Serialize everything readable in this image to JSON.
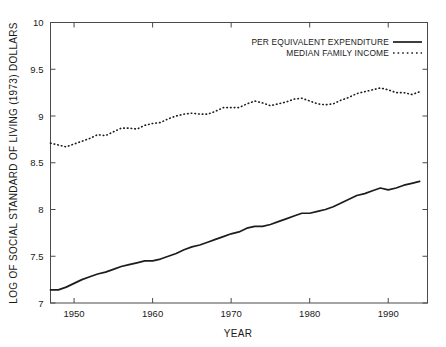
{
  "chart_data": {
    "type": "line",
    "title": "",
    "xlabel": "YEAR",
    "ylabel": "LOG OF SOCIAL STANDARD OF LIVING (1973) DOLLARS",
    "xlim": [
      1947,
      1995
    ],
    "ylim": [
      7,
      10
    ],
    "xticks": [
      1950,
      1960,
      1970,
      1980,
      1990
    ],
    "xticklabels": [
      "1950",
      "1960",
      "1970",
      "1980",
      "1990"
    ],
    "yticks": [
      7,
      7.5,
      8,
      8.5,
      9,
      9.5,
      10
    ],
    "yticklabels": [
      "7",
      "7.5",
      "8",
      "8.5",
      "9",
      "9.5",
      "10"
    ],
    "grid": false,
    "legend_position": "top-right",
    "x": [
      1947,
      1948,
      1949,
      1950,
      1951,
      1952,
      1953,
      1954,
      1955,
      1956,
      1957,
      1958,
      1959,
      1960,
      1961,
      1962,
      1963,
      1964,
      1965,
      1966,
      1967,
      1968,
      1969,
      1970,
      1971,
      1972,
      1973,
      1974,
      1975,
      1976,
      1977,
      1978,
      1979,
      1980,
      1981,
      1982,
      1983,
      1984,
      1985,
      1986,
      1987,
      1988,
      1989,
      1990,
      1991,
      1992,
      1993,
      1994
    ],
    "series": [
      {
        "name": "PER EQUIVALENT EXPENDITURE",
        "style": "solid",
        "values": [
          7.14,
          7.14,
          7.17,
          7.21,
          7.25,
          7.28,
          7.31,
          7.33,
          7.36,
          7.39,
          7.41,
          7.43,
          7.45,
          7.45,
          7.47,
          7.5,
          7.53,
          7.57,
          7.6,
          7.62,
          7.65,
          7.68,
          7.71,
          7.74,
          7.76,
          7.8,
          7.82,
          7.82,
          7.84,
          7.87,
          7.9,
          7.93,
          7.96,
          7.96,
          7.98,
          8.0,
          8.03,
          8.07,
          8.11,
          8.15,
          8.17,
          8.2,
          8.23,
          8.21,
          8.23,
          8.26,
          8.28,
          8.3
        ]
      },
      {
        "name": "MEDIAN FAMILY INCOME",
        "style": "dotted",
        "values": [
          8.71,
          8.69,
          8.67,
          8.7,
          8.73,
          8.76,
          8.8,
          8.79,
          8.83,
          8.87,
          8.87,
          8.86,
          8.9,
          8.92,
          8.93,
          8.97,
          9.0,
          9.02,
          9.03,
          9.02,
          9.02,
          9.05,
          9.09,
          9.09,
          9.09,
          9.13,
          9.16,
          9.14,
          9.11,
          9.13,
          9.15,
          9.18,
          9.19,
          9.16,
          9.13,
          9.12,
          9.13,
          9.17,
          9.2,
          9.24,
          9.26,
          9.28,
          9.3,
          9.28,
          9.25,
          9.25,
          9.23,
          9.26
        ]
      }
    ],
    "legend": [
      {
        "label": "PER EQUIVALENT EXPENDITURE",
        "style": "solid"
      },
      {
        "label": "MEDIAN FAMILY INCOME",
        "style": "dotted"
      }
    ]
  },
  "colors": {
    "line": "#1c1c1c",
    "axis": "#4a4a4a",
    "background": "#ffffff"
  }
}
